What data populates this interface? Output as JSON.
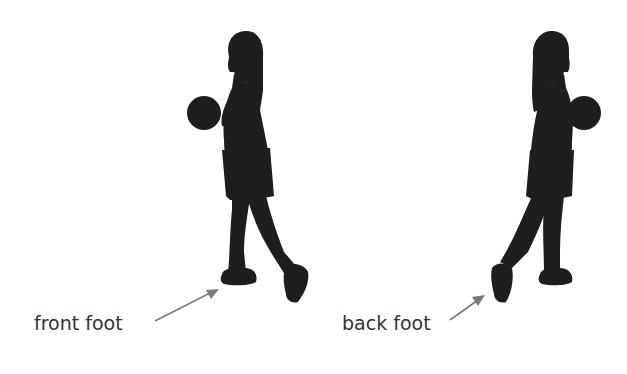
{
  "diagram": {
    "figures": [
      {
        "name": "player-facing-left",
        "label": "front foot",
        "arrow_target": "front-foot"
      },
      {
        "name": "player-facing-right",
        "label": "back foot",
        "arrow_target": "back-foot"
      }
    ],
    "labels": {
      "left": "front foot",
      "right": "back foot"
    },
    "colors": {
      "silhouette": "#1e1e1e",
      "arrow": "#7a7a7a",
      "text": "#333333",
      "background": "#ffffff"
    }
  }
}
